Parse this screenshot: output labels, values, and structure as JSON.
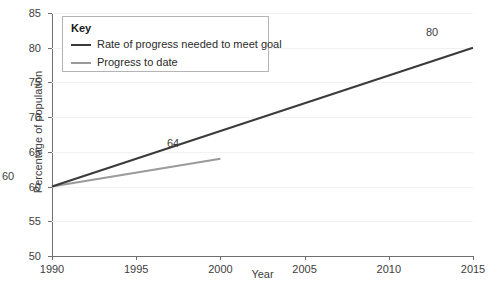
{
  "chart_data": {
    "type": "line",
    "title": "",
    "xlabel": "Year",
    "ylabel": "Percentage of population",
    "xlim": [
      1990,
      2015
    ],
    "ylim": [
      50,
      85
    ],
    "xticks": [
      1990,
      1995,
      2000,
      2005,
      2010,
      2015
    ],
    "yticks": [
      50,
      55,
      60,
      65,
      70,
      75,
      80,
      85
    ],
    "grid": true,
    "legend_position": "upper-left-inside",
    "legend_title": "Key",
    "series": [
      {
        "name": "Rate of progress needed to meet goal",
        "color": "#3a3a3a",
        "x": [
          1990,
          2015
        ],
        "values": [
          60,
          80
        ],
        "point_labels": [
          {
            "text": "60",
            "x": 1990,
            "y": 60
          },
          {
            "text": "80",
            "x": 2015,
            "y": 80
          }
        ]
      },
      {
        "name": "Progress to date",
        "color": "#9a9a9a",
        "x": [
          1990,
          2000
        ],
        "values": [
          60,
          64
        ],
        "point_labels": [
          {
            "text": "64",
            "x": 2000,
            "y": 64
          }
        ]
      }
    ]
  },
  "axes": {
    "ylabel": "Percentage of population",
    "xlabel": "Year",
    "yticks": [
      "85",
      "80",
      "75",
      "70",
      "65",
      "60",
      "55",
      "50"
    ],
    "xticks": [
      "1990",
      "1995",
      "2000",
      "2005",
      "2010",
      "2015"
    ]
  },
  "legend": {
    "title": "Key",
    "items": [
      {
        "label": "Rate of progress needed to meet goal",
        "color": "#3a3a3a"
      },
      {
        "label": "Progress to date",
        "color": "#9a9a9a"
      }
    ]
  },
  "point_labels": {
    "start": "60",
    "progress_end": "64",
    "goal_end": "80"
  },
  "colors": {
    "goal_line": "#3a3a3a",
    "progress_line": "#9a9a9a",
    "axis": "#6e6e6e",
    "grid": "#f2f2f2",
    "text": "#3d3d3d",
    "background": "#ffffff"
  }
}
